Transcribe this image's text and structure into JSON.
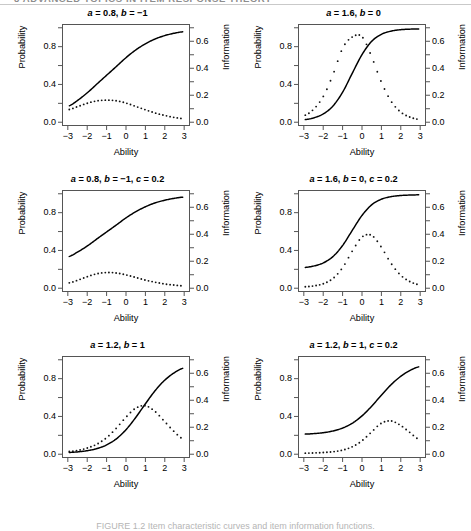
{
  "page": {
    "running_head": "8   ADVANCED TOPICS IN ITEM RESPONSE THEORY",
    "caption": "FIGURE 1.2  Item characteristic curves and item information functions."
  },
  "axes": {
    "xlabel": "Ability",
    "ylabel_left": "Probability",
    "ylabel_right": "Information",
    "xticks": [
      "-3",
      "-2",
      "-1",
      "0",
      "1",
      "2",
      "3"
    ],
    "yticks_left": [
      "0.0",
      "0.4",
      "0.8"
    ],
    "yticks_right": [
      "0.0",
      "0.2",
      "0.4",
      "0.6"
    ],
    "xlim": [
      -3.3,
      3.3
    ],
    "ylim_left": [
      -0.04,
      1.04
    ],
    "ylim_right": [
      -0.028,
      0.728
    ]
  },
  "chart_data": [
    {
      "type": "line",
      "panel": 1,
      "title": "a = 0.8, b = -1",
      "title_parts": [
        {
          "var": "a",
          "val": " = 0.8, "
        },
        {
          "var": "b",
          "val": " = −1"
        }
      ],
      "params": {
        "a": 0.8,
        "b": -1,
        "c": 0
      },
      "xlabel": "Ability",
      "ylabel": "Probability",
      "ylabel2": "Information",
      "xlim": [
        -3.3,
        3.3
      ],
      "ylim": [
        -0.04,
        1.04
      ],
      "ylim2": [
        -0.028,
        0.728
      ],
      "series": [
        {
          "name": "Item characteristic curve",
          "style": "solid",
          "axis": "left",
          "x": [
            -3,
            -2.5,
            -2,
            -1.5,
            -1,
            -0.5,
            0,
            0.5,
            1,
            1.5,
            2,
            2.5,
            3
          ],
          "values": [
            0.165,
            0.231,
            0.313,
            0.407,
            0.5,
            0.593,
            0.687,
            0.769,
            0.835,
            0.887,
            0.924,
            0.95,
            0.967
          ]
        },
        {
          "name": "Item information function",
          "style": "dotted",
          "axis": "right",
          "x": [
            -3,
            -2.5,
            -2,
            -1.5,
            -1,
            -0.5,
            0,
            0.5,
            1,
            1.5,
            2,
            2.5,
            3
          ],
          "values": [
            0.088,
            0.113,
            0.138,
            0.155,
            0.16,
            0.155,
            0.138,
            0.113,
            0.088,
            0.064,
            0.045,
            0.03,
            0.02
          ]
        }
      ]
    },
    {
      "type": "line",
      "panel": 2,
      "title": "a = 1.6, b = 0",
      "title_parts": [
        {
          "var": "a",
          "val": " = 1.6, "
        },
        {
          "var": "b",
          "val": " = 0"
        }
      ],
      "params": {
        "a": 1.6,
        "b": 0,
        "c": 0
      },
      "xlabel": "Ability",
      "ylabel": "Probability",
      "ylabel2": "Information",
      "xlim": [
        -3.3,
        3.3
      ],
      "ylim": [
        -0.04,
        1.04
      ],
      "ylim2": [
        -0.028,
        0.728
      ],
      "series": [
        {
          "name": "Item characteristic curve",
          "style": "solid",
          "axis": "left",
          "x": [
            -3,
            -2.5,
            -2,
            -1.5,
            -1,
            -0.5,
            0,
            0.5,
            1,
            1.5,
            2,
            2.5,
            3
          ],
          "values": [
            0.018,
            0.039,
            0.083,
            0.17,
            0.32,
            0.523,
            0.72,
            0.862,
            0.938,
            0.973,
            0.989,
            0.995,
            0.998
          ]
        },
        {
          "name": "Item information function",
          "style": "dotted",
          "axis": "right",
          "x": [
            -3,
            -2.5,
            -2,
            -1.5,
            -1,
            -0.5,
            0,
            0.5,
            1,
            1.5,
            2,
            2.5,
            3
          ],
          "values": [
            0.045,
            0.096,
            0.195,
            0.361,
            0.557,
            0.638,
            0.64,
            0.49,
            0.301,
            0.157,
            0.073,
            0.032,
            0.014
          ]
        }
      ]
    },
    {
      "type": "line",
      "panel": 3,
      "title": "a = 0.8, b = -1, c = 0.2",
      "title_parts": [
        {
          "var": "a",
          "val": " = 0.8, "
        },
        {
          "var": "b",
          "val": " = −1, "
        },
        {
          "var": "c",
          "val": " = 0.2"
        }
      ],
      "params": {
        "a": 0.8,
        "b": -1,
        "c": 0.2
      },
      "xlabel": "Ability",
      "ylabel": "Probability",
      "ylabel2": "Information",
      "xlim": [
        -3.3,
        3.3
      ],
      "ylim": [
        -0.04,
        1.04
      ],
      "ylim2": [
        -0.028,
        0.728
      ],
      "series": [
        {
          "name": "Item characteristic curve",
          "style": "solid",
          "axis": "left",
          "x": [
            -3,
            -2.5,
            -2,
            -1.5,
            -1,
            -0.5,
            0,
            0.5,
            1,
            1.5,
            2,
            2.5,
            3
          ],
          "values": [
            0.332,
            0.385,
            0.45,
            0.526,
            0.6,
            0.674,
            0.75,
            0.815,
            0.868,
            0.91,
            0.939,
            0.96,
            0.974
          ]
        },
        {
          "name": "Item information function",
          "style": "dotted",
          "axis": "right",
          "x": [
            -3,
            -2.5,
            -2,
            -1.5,
            -1,
            -0.5,
            0,
            0.5,
            1,
            1.5,
            2,
            2.5,
            3
          ],
          "values": [
            0.033,
            0.055,
            0.082,
            0.103,
            0.112,
            0.108,
            0.094,
            0.075,
            0.055,
            0.039,
            0.026,
            0.017,
            0.011
          ]
        }
      ]
    },
    {
      "type": "line",
      "panel": 4,
      "title": "a = 1.6, b = 0, c = 0.2",
      "title_parts": [
        {
          "var": "a",
          "val": " = 1.6, "
        },
        {
          "var": "b",
          "val": " = 0, "
        },
        {
          "var": "c",
          "val": " = 0.2"
        }
      ],
      "params": {
        "a": 1.6,
        "b": 0,
        "c": 0.2
      },
      "xlabel": "Ability",
      "ylabel": "Probability",
      "ylabel2": "Information",
      "xlim": [
        -3.3,
        3.3
      ],
      "ylim": [
        -0.04,
        1.04
      ],
      "ylim2": [
        -0.028,
        0.728
      ],
      "series": [
        {
          "name": "Item characteristic curve",
          "style": "solid",
          "axis": "left",
          "x": [
            -3,
            -2.5,
            -2,
            -1.5,
            -1,
            -0.5,
            0,
            0.5,
            1,
            1.5,
            2,
            2.5,
            3
          ],
          "values": [
            0.214,
            0.231,
            0.266,
            0.336,
            0.456,
            0.618,
            0.776,
            0.89,
            0.95,
            0.978,
            0.991,
            0.996,
            0.999
          ]
        },
        {
          "name": "Item information function",
          "style": "dotted",
          "axis": "right",
          "x": [
            -3,
            -2.5,
            -2,
            -1.5,
            -1,
            -0.5,
            0,
            0.5,
            1,
            1.5,
            2,
            2.5,
            3
          ],
          "values": [
            0.004,
            0.011,
            0.028,
            0.069,
            0.152,
            0.276,
            0.38,
            0.393,
            0.306,
            0.186,
            0.095,
            0.044,
            0.019
          ]
        }
      ]
    },
    {
      "type": "line",
      "panel": 5,
      "title": "a = 1.2, b = 1",
      "title_parts": [
        {
          "var": "a",
          "val": " = 1.2, "
        },
        {
          "var": "b",
          "val": " = 1"
        }
      ],
      "params": {
        "a": 1.2,
        "b": 1,
        "c": 0
      },
      "xlabel": "Ability",
      "ylabel": "Probability",
      "ylabel2": "Information",
      "xlim": [
        -3.3,
        3.3
      ],
      "ylim": [
        -0.04,
        1.04
      ],
      "ylim2": [
        -0.028,
        0.728
      ],
      "series": [
        {
          "name": "Item characteristic curve",
          "style": "solid",
          "axis": "left",
          "x": [
            -3,
            -2.5,
            -2,
            -1.5,
            -1,
            -0.5,
            0,
            0.5,
            1,
            1.5,
            2,
            2.5,
            3
          ],
          "values": [
            0.009,
            0.016,
            0.029,
            0.052,
            0.092,
            0.157,
            0.255,
            0.384,
            0.53,
            0.67,
            0.784,
            0.866,
            0.919
          ]
        },
        {
          "name": "Item information function",
          "style": "dotted",
          "axis": "right",
          "x": [
            -3,
            -2.5,
            -2,
            -1.5,
            -1,
            -0.5,
            0,
            0.5,
            1,
            1.5,
            2,
            2.5,
            3
          ],
          "values": [
            0.013,
            0.023,
            0.041,
            0.071,
            0.12,
            0.191,
            0.273,
            0.34,
            0.36,
            0.319,
            0.244,
            0.167,
            0.107
          ]
        }
      ]
    },
    {
      "type": "line",
      "panel": 6,
      "title": "a = 1.2, b = 1, c = 0.2",
      "title_parts": [
        {
          "var": "a",
          "val": " = 1.2, "
        },
        {
          "var": "b",
          "val": " = 1, "
        },
        {
          "var": "c",
          "val": " = 0.2"
        }
      ],
      "params": {
        "a": 1.2,
        "b": 1,
        "c": 0.2
      },
      "xlabel": "Ability",
      "ylabel": "Probability",
      "ylabel2": "Information",
      "xlim": [
        -3.3,
        3.3
      ],
      "ylim": [
        -0.04,
        1.04
      ],
      "ylim2": [
        -0.028,
        0.728
      ],
      "series": [
        {
          "name": "Item characteristic curve",
          "style": "solid",
          "axis": "left",
          "x": [
            -3,
            -2.5,
            -2,
            -1.5,
            -1,
            -0.5,
            0,
            0.5,
            1,
            1.5,
            2,
            2.5,
            3
          ],
          "values": [
            0.207,
            0.213,
            0.223,
            0.242,
            0.274,
            0.326,
            0.404,
            0.507,
            0.624,
            0.736,
            0.827,
            0.893,
            0.935
          ]
        },
        {
          "name": "Item information function",
          "style": "dotted",
          "axis": "right",
          "x": [
            -3,
            -2.5,
            -2,
            -1.5,
            -1,
            -0.5,
            0,
            0.5,
            1,
            1.5,
            2,
            2.5,
            3
          ],
          "values": [
            0.001,
            0.003,
            0.006,
            0.012,
            0.025,
            0.05,
            0.095,
            0.161,
            0.226,
            0.245,
            0.213,
            0.158,
            0.104
          ]
        }
      ]
    }
  ]
}
